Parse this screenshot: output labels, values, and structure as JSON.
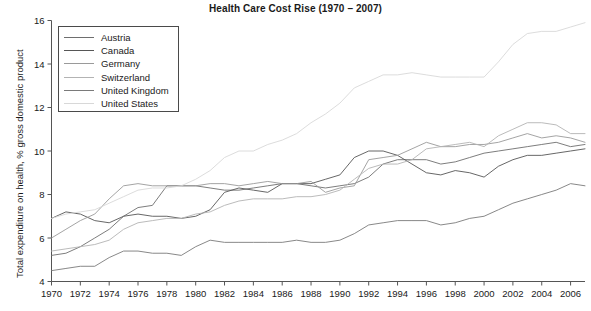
{
  "chart_data": {
    "type": "line",
    "title": "Health Care Cost Rise (1970 – 2007)",
    "xlabel": "",
    "ylabel": "Total expenditure on health, % gross domestic product",
    "xlim": [
      1970,
      2007
    ],
    "ylim": [
      4,
      16
    ],
    "grid": false,
    "legend_position": "top-left",
    "xticks": [
      1970,
      1972,
      1974,
      1976,
      1978,
      1980,
      1982,
      1984,
      1986,
      1988,
      1990,
      1992,
      1994,
      1996,
      1998,
      2000,
      2002,
      2004,
      2006
    ],
    "yticks": [
      4,
      6,
      8,
      10,
      12,
      14,
      16
    ],
    "x": [
      1970,
      1971,
      1972,
      1973,
      1974,
      1975,
      1976,
      1977,
      1978,
      1979,
      1980,
      1981,
      1982,
      1983,
      1984,
      1985,
      1986,
      1987,
      1988,
      1989,
      1990,
      1991,
      1992,
      1993,
      1994,
      1995,
      1996,
      1997,
      1998,
      1999,
      2000,
      2001,
      2002,
      2003,
      2004,
      2005,
      2006,
      2007
    ],
    "series": [
      {
        "name": "Austria",
        "color": "#6e6e6e",
        "values": [
          5.2,
          5.3,
          5.6,
          6.0,
          6.4,
          7.0,
          7.4,
          7.5,
          8.4,
          8.4,
          8.4,
          8.3,
          8.2,
          8.2,
          8.3,
          8.4,
          8.5,
          8.5,
          8.4,
          8.3,
          8.4,
          8.5,
          8.8,
          9.4,
          9.6,
          9.6,
          9.6,
          9.4,
          9.5,
          9.7,
          9.9,
          10.0,
          10.1,
          10.2,
          10.3,
          10.4,
          10.2,
          10.3
        ]
      },
      {
        "name": "Canada",
        "color": "#565656",
        "values": [
          6.9,
          7.2,
          7.1,
          6.8,
          6.7,
          7.0,
          7.1,
          7.0,
          7.0,
          6.9,
          7.0,
          7.3,
          8.1,
          8.3,
          8.2,
          8.1,
          8.5,
          8.5,
          8.5,
          8.7,
          8.9,
          9.7,
          10.0,
          10.0,
          9.8,
          9.4,
          9.0,
          8.9,
          9.1,
          9.0,
          8.8,
          9.3,
          9.6,
          9.8,
          9.8,
          9.9,
          10.0,
          10.1
        ]
      },
      {
        "name": "Germany",
        "color": "#9a9a9a",
        "values": [
          6.0,
          6.4,
          6.8,
          7.1,
          7.8,
          8.4,
          8.5,
          8.4,
          8.4,
          8.4,
          8.4,
          8.5,
          8.5,
          8.4,
          8.5,
          8.6,
          8.5,
          8.5,
          8.6,
          8.1,
          8.3,
          8.4,
          9.6,
          9.7,
          9.8,
          10.1,
          10.4,
          10.2,
          10.2,
          10.3,
          10.3,
          10.4,
          10.6,
          10.8,
          10.6,
          10.7,
          10.6,
          10.4
        ]
      },
      {
        "name": "Switzerland",
        "color": "#b3b3b3",
        "values": [
          5.4,
          5.5,
          5.6,
          5.7,
          5.9,
          6.4,
          6.7,
          6.8,
          6.9,
          6.9,
          7.1,
          7.2,
          7.5,
          7.7,
          7.8,
          7.8,
          7.8,
          7.9,
          7.9,
          8.0,
          8.2,
          8.7,
          9.2,
          9.4,
          9.4,
          9.6,
          10.1,
          10.2,
          10.3,
          10.4,
          10.2,
          10.7,
          11.0,
          11.3,
          11.3,
          11.2,
          10.8,
          10.8
        ]
      },
      {
        "name": "United Kingdom",
        "color": "#7a7a7a",
        "values": [
          4.5,
          4.6,
          4.7,
          4.7,
          5.1,
          5.4,
          5.4,
          5.3,
          5.3,
          5.2,
          5.6,
          5.9,
          5.8,
          5.8,
          5.8,
          5.8,
          5.8,
          5.9,
          5.8,
          5.8,
          5.9,
          6.2,
          6.6,
          6.7,
          6.8,
          6.8,
          6.8,
          6.6,
          6.7,
          6.9,
          7.0,
          7.3,
          7.6,
          7.8,
          8.0,
          8.2,
          8.5,
          8.4
        ]
      },
      {
        "name": "United States",
        "color": "#d8d8d8",
        "values": [
          6.9,
          7.1,
          7.2,
          7.3,
          7.6,
          7.9,
          8.2,
          8.3,
          8.3,
          8.4,
          8.7,
          9.1,
          9.7,
          10.0,
          10.0,
          10.3,
          10.5,
          10.8,
          11.3,
          11.7,
          12.2,
          12.9,
          13.2,
          13.5,
          13.5,
          13.6,
          13.5,
          13.4,
          13.4,
          13.4,
          13.4,
          14.1,
          14.9,
          15.4,
          15.5,
          15.5,
          15.7,
          15.9
        ]
      }
    ]
  },
  "legend": {
    "items": [
      {
        "label": "Austria"
      },
      {
        "label": "Canada"
      },
      {
        "label": "Germany"
      },
      {
        "label": "Switzerland"
      },
      {
        "label": "United Kingdom"
      },
      {
        "label": "United States"
      }
    ]
  }
}
